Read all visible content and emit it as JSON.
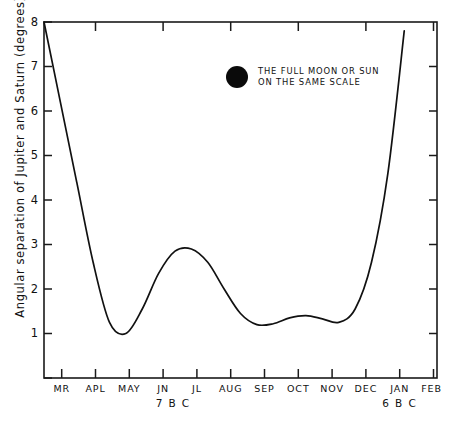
{
  "chart_data": {
    "type": "line",
    "title": "",
    "subtitle": "",
    "xlabel": "",
    "ylabel": "Angular separation of Jupiter and Saturn (degrees)",
    "ylim": [
      0,
      8
    ],
    "xlim": [
      0,
      12
    ],
    "grid": false,
    "legend_position": "inside-top-center",
    "y_ticks": [
      1,
      2,
      3,
      4,
      5,
      6,
      7,
      8
    ],
    "y_tick_labels": [
      "1",
      "2",
      "3",
      "4",
      "5",
      "6",
      "7",
      "8"
    ],
    "x_tick_labels": [
      "MR",
      "APL",
      "MAY",
      "JN",
      "JL",
      "AUG",
      "SEP",
      "OCT",
      "NOV",
      "DEC",
      "JAN",
      "FEB"
    ],
    "era_labels": [
      {
        "text": "7 B C",
        "at_month": "JN"
      },
      {
        "text": "6 B C",
        "at_month": "JAN"
      }
    ],
    "annotations": [
      {
        "name": "full-moon-scale-legend",
        "marker": "filled-circle",
        "marker_diameter_degrees": 0.5,
        "line1": "THE FULL MOON OR SUN",
        "line2": "ON THE SAME SCALE"
      }
    ],
    "series": [
      {
        "name": "Angular separation of Jupiter and Saturn",
        "color": "#111111",
        "x": [
          "MR",
          "MR+",
          "APL",
          "APL+",
          "MAY",
          "MAY+",
          "JN",
          "JN+",
          "JL",
          "JL+",
          "AUG",
          "AUG+",
          "SEP",
          "SEP+",
          "OCT",
          "OCT+",
          "NOV",
          "NOV+",
          "DEC",
          "DEC+",
          "JAN",
          "JAN+",
          "FEB"
        ],
        "x_numeric": [
          0,
          0.5,
          1,
          1.5,
          2,
          2.5,
          3,
          3.5,
          4,
          4.5,
          5,
          5.5,
          6,
          6.5,
          7,
          7.5,
          8,
          8.5,
          9,
          9.5,
          10,
          10.5,
          11
        ],
        "values": [
          8.0,
          6.2,
          4.4,
          2.6,
          1.25,
          1.0,
          1.55,
          2.35,
          2.85,
          2.9,
          2.6,
          2.0,
          1.45,
          1.2,
          1.22,
          1.35,
          1.4,
          1.33,
          1.25,
          1.55,
          2.6,
          4.6,
          7.8
        ],
        "key_points": [
          {
            "label": "start",
            "month": "MR",
            "value": 8.0
          },
          {
            "label": "first-minimum",
            "month": "MAY",
            "value": 1.0
          },
          {
            "label": "local-maximum",
            "month": "JL",
            "value": 2.9
          },
          {
            "label": "second-minimum",
            "month": "SEP",
            "value": 1.2
          },
          {
            "label": "small-bump",
            "month": "NOV",
            "value": 1.4
          },
          {
            "label": "third-minimum",
            "month": "DEC",
            "value": 1.25
          },
          {
            "label": "end",
            "month": "FEB",
            "value": 7.8
          }
        ]
      }
    ]
  },
  "axis": {
    "y_label_text": "Angular separation of Jupiter and Saturn (degrees)"
  }
}
